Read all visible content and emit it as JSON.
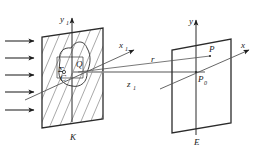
{
  "figure": {
    "background_color": "#ffffff",
    "line_color": "#2b2b2b",
    "hatch_color": "#6f6f6f",
    "axis_grey_color": "#8e8e8e",
    "width": 259,
    "height": 150
  },
  "labels": {
    "y1_axis": "y",
    "y1_axis_sub": "1",
    "x1_axis": "x",
    "x1_axis_sub": "1",
    "z1_axis": "z",
    "z1_axis_sub": "1",
    "y_axis": "y",
    "x_axis": "x",
    "sigma_aperture": "Σ",
    "center_point": "C",
    "source_point": "Q",
    "observation_point": "P",
    "axial_point": "P",
    "axial_point_sub": "0",
    "ray_vector": "r",
    "screen_label": "K",
    "plane_label": "E"
  },
  "elements": {
    "incident_wave_arrows": 5,
    "screen_k_description": "hatched parallelogram opaque screen",
    "plane_e_description": "unhatched parallelogram observation plane",
    "aperture_description": "irregular closed curve opening in screen"
  },
  "geometry": {
    "screen_k_polygon": "42,128 42,37 103,28 103,119",
    "plane_e_polygon": "172,133 172,50 231,39 231,123",
    "aperture_path": "M 60,60 C 58,52 64,47 71,48 C 76,40 84,40 87,48 C 92,56 90,66 87,72 C 88,82 80,88 72,86 C 63,85 58,78 59,70 Z"
  }
}
